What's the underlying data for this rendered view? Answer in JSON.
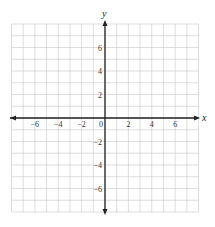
{
  "chart_data": {
    "type": "scatter",
    "title": "",
    "xlabel": "x",
    "ylabel": "y",
    "xlim": [
      -8,
      8
    ],
    "ylim": [
      -8,
      8
    ],
    "grid": true,
    "grid_step": 1,
    "x_ticks": [
      -6,
      -4,
      -2,
      0,
      2,
      4,
      6
    ],
    "y_ticks": [
      6,
      4,
      2,
      -2,
      -4,
      -6
    ],
    "x_tick_labels": [
      "−6",
      "−4",
      "−2",
      "0",
      "2",
      "4",
      "6"
    ],
    "y_tick_labels": [
      "6",
      "4",
      "2",
      "−2",
      "−4",
      "−6"
    ],
    "series": [],
    "legend": null
  },
  "colors": {
    "grid": "#c8c8c8",
    "axis": "#222222",
    "background": "#ffffff"
  }
}
